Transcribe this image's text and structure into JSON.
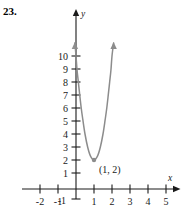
{
  "problem": {
    "number": "23."
  },
  "chart_data": {
    "type": "line",
    "title": "",
    "xlabel": "x",
    "ylabel": "y",
    "xlim": [
      -2.8,
      5.9
    ],
    "ylim": [
      -1.4,
      11.2
    ],
    "grid": false,
    "legend": null,
    "x_ticks": [
      -2,
      -1,
      1,
      2,
      3,
      4,
      5
    ],
    "x_tick_labels": [
      "-2",
      "-1",
      "1",
      "2",
      "3",
      "4",
      "5"
    ],
    "y_ticks": [
      -1,
      1,
      2,
      3,
      4,
      5,
      6,
      7,
      8,
      9,
      10
    ],
    "y_tick_labels": [
      "-1",
      "1",
      "2",
      "3",
      "4",
      "5",
      "6",
      "7",
      "8",
      "9",
      "10"
    ],
    "curve": {
      "equation": "y = 8(x - 1)^2 + 2",
      "vertex": [
        1,
        2
      ],
      "vertex_label": "(1, 2)",
      "color": "#808080",
      "x_range": [
        -0.06,
        2.09
      ],
      "arrow_ends": [
        "left-top",
        "right-top"
      ],
      "points": [
        [
          -0.06,
          11.0
        ],
        [
          0.0,
          10.0
        ],
        [
          0.06,
          8.9
        ],
        [
          0.13,
          8.0
        ],
        [
          0.2,
          7.1
        ],
        [
          0.29,
          6.0
        ],
        [
          0.38,
          5.1
        ],
        [
          0.5,
          4.0
        ],
        [
          0.65,
          2.98
        ],
        [
          0.8,
          2.32
        ],
        [
          1.0,
          2.0
        ],
        [
          1.2,
          2.32
        ],
        [
          1.35,
          2.98
        ],
        [
          1.5,
          4.0
        ],
        [
          1.62,
          5.1
        ],
        [
          1.71,
          6.0
        ],
        [
          1.8,
          7.1
        ],
        [
          1.87,
          8.0
        ],
        [
          1.94,
          8.9
        ],
        [
          2.0,
          10.0
        ],
        [
          2.09,
          11.0
        ]
      ]
    },
    "axes": {
      "x_axis_arrow": true,
      "y_axis_arrow": true,
      "axis_color": "#1a1a1a"
    }
  }
}
